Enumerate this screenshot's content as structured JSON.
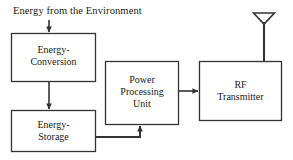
{
  "diagram": {
    "caption": "Energy from the Environment",
    "stroke_color": "#333333",
    "background_color": "#ffffff",
    "blocks": [
      {
        "id": "energy-conversion",
        "lines": [
          "Energy-",
          "Conversion"
        ],
        "x": 11,
        "y": 33,
        "w": 85,
        "h": 49
      },
      {
        "id": "energy-storage",
        "lines": [
          "Energy-",
          "Storage"
        ],
        "x": 11,
        "y": 110,
        "w": 85,
        "h": 42
      },
      {
        "id": "power-processing-unit",
        "lines": [
          "Power",
          "Processing",
          "Unit"
        ],
        "x": 105,
        "y": 61,
        "w": 74,
        "h": 64
      },
      {
        "id": "rf-transmitter",
        "lines": [
          "RF",
          "Transmitter"
        ],
        "x": 199,
        "y": 61,
        "w": 83,
        "h": 60
      }
    ],
    "connections": [
      {
        "id": "environment-to-conversion",
        "from": "environment",
        "to": "energy-conversion"
      },
      {
        "id": "conversion-to-storage",
        "from": "energy-conversion",
        "to": "energy-storage"
      },
      {
        "id": "storage-to-ppu",
        "from": "energy-storage",
        "to": "power-processing-unit"
      },
      {
        "id": "ppu-to-rf",
        "from": "power-processing-unit",
        "to": "rf-transmitter"
      },
      {
        "id": "rf-to-antenna",
        "from": "rf-transmitter",
        "to": "antenna"
      }
    ],
    "antenna": {
      "id": "antenna",
      "symbol": "dipole-antenna",
      "x": 264,
      "y": 13
    }
  }
}
